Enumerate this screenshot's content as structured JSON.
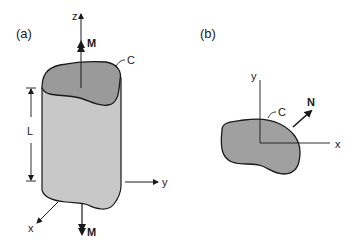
{
  "figure": {
    "panel_a": {
      "label": "(a)",
      "axis_z": "z",
      "axis_y": "y",
      "axis_x": "x",
      "moment_top": "M",
      "moment_bottom": "M",
      "curve_label": "C",
      "length_label": "L"
    },
    "panel_b": {
      "label": "(b)",
      "axis_y": "y",
      "axis_x": "x",
      "curve_label": "C",
      "normal_label": "N"
    },
    "colors": {
      "top_face": "#9a9a9a",
      "body": "#c8c8c8",
      "section": "#a0a0a0",
      "stroke": "#1a1a1a"
    }
  }
}
